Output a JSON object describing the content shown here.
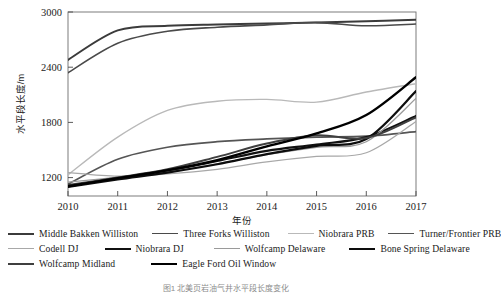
{
  "axes": {
    "ylabel": "水平段长度/m",
    "xlabel": "年份",
    "yticks": [
      "1200",
      "1800",
      "2400",
      "3000"
    ],
    "xticks": [
      "2010",
      "2011",
      "2012",
      "2013",
      "2014",
      "2015",
      "2016",
      "2017"
    ]
  },
  "caption": "图1 北美页岩油气井水平段长度变化",
  "legend": {
    "rows": [
      [
        {
          "label": "Middle Bakken Williston",
          "color": "#3b3b3b",
          "width": 2.0
        },
        {
          "label": "Three Forks Williston",
          "color": "#4a4a4a",
          "width": 1.6
        },
        {
          "label": "Niobrara PRB",
          "color": "#b9b9b9",
          "width": 1.4
        },
        {
          "label": "Turner/Frontier PRB",
          "color": "#555555",
          "width": 1.7
        }
      ],
      [
        {
          "label": "Codell DJ",
          "color": "#a8a8a8",
          "width": 1.3
        },
        {
          "label": "Niobrara DJ",
          "color": "#111111",
          "width": 2.2
        },
        {
          "label": "Wolfcamp Delaware",
          "color": "#9a9a9a",
          "width": 1.3
        },
        {
          "label": "Bone Spring Delaware",
          "color": "#0d0d0d",
          "width": 2.2
        }
      ],
      [
        {
          "label": "Wolfcamp Midland",
          "color": "#3f3f3f",
          "width": 2.0
        },
        {
          "label": "Eagle Ford Oil Window",
          "color": "#000000",
          "width": 2.4
        }
      ]
    ]
  },
  "chart_data": {
    "type": "line",
    "title": "",
    "xlabel": "年份",
    "ylabel": "水平段长度/m",
    "x": [
      2010,
      2011,
      2012,
      2013,
      2014,
      2015,
      2016,
      2017
    ],
    "xlim": [
      2010,
      2017
    ],
    "ylim": [
      1000,
      3000
    ],
    "yticks": [
      1200,
      1800,
      2400,
      3000
    ],
    "grid": false,
    "legend_position": "below",
    "series": [
      {
        "name": "Middle Bakken Williston",
        "color": "#3b3b3b",
        "width": 2.0,
        "values": [
          2480,
          2800,
          2850,
          2865,
          2875,
          2885,
          2900,
          2915
        ]
      },
      {
        "name": "Three Forks Williston",
        "color": "#4a4a4a",
        "width": 1.6,
        "values": [
          2340,
          2660,
          2790,
          2835,
          2860,
          2885,
          2850,
          2870
        ]
      },
      {
        "name": "Niobrara PRB",
        "color": "#b9b9b9",
        "width": 1.4,
        "values": [
          1230,
          1640,
          1930,
          2030,
          2050,
          2020,
          2130,
          2220
        ]
      },
      {
        "name": "Turner/Frontier PRB",
        "color": "#555555",
        "width": 1.7,
        "values": [
          1130,
          1400,
          1530,
          1590,
          1620,
          1640,
          1650,
          1700
        ]
      },
      {
        "name": "Codell DJ",
        "color": "#a8a8a8",
        "width": 1.3,
        "values": [
          1255,
          1215,
          1240,
          1290,
          1370,
          1430,
          1470,
          1810
        ]
      },
      {
        "name": "Niobrara DJ",
        "color": "#111111",
        "width": 2.2,
        "values": [
          1110,
          1190,
          1270,
          1380,
          1490,
          1560,
          1640,
          1870
        ]
      },
      {
        "name": "Wolfcamp Delaware",
        "color": "#9a9a9a",
        "width": 1.3,
        "values": [
          1150,
          1205,
          1265,
          1350,
          1450,
          1530,
          1590,
          2060
        ]
      },
      {
        "name": "Bone Spring Delaware",
        "color": "#0d0d0d",
        "width": 2.2,
        "values": [
          1100,
          1180,
          1255,
          1345,
          1455,
          1545,
          1620,
          2140
        ]
      },
      {
        "name": "Wolfcamp Midland",
        "color": "#3f3f3f",
        "width": 2.0,
        "values": [
          1120,
          1200,
          1290,
          1425,
          1570,
          1660,
          1630,
          1855
        ]
      },
      {
        "name": "Eagle Ford Oil Window",
        "color": "#000000",
        "width": 2.4,
        "values": [
          1105,
          1195,
          1280,
          1390,
          1540,
          1680,
          1880,
          2290
        ]
      }
    ]
  }
}
